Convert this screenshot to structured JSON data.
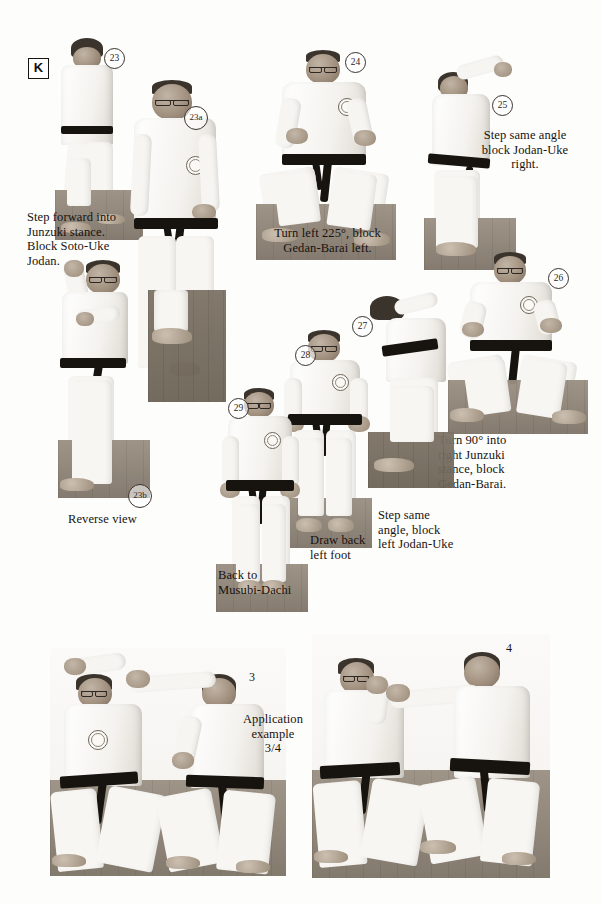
{
  "page": {
    "section_letter": "K",
    "background": "#fdfdfc",
    "ink_color": "#17120f"
  },
  "figures": [
    {
      "id": "23",
      "label": "23"
    },
    {
      "id": "23a",
      "label": "23a"
    },
    {
      "id": "23b",
      "label": "23b"
    },
    {
      "id": "24",
      "label": "24"
    },
    {
      "id": "25",
      "label": "25"
    },
    {
      "id": "26",
      "label": "26"
    },
    {
      "id": "27",
      "label": "27"
    },
    {
      "id": "28",
      "label": "28"
    },
    {
      "id": "29",
      "label": "29"
    }
  ],
  "captions": {
    "step23": "Step forward into\nJunzuki stance.\nBlock Soto-Uke\nJodan.",
    "reverse_view": "Reverse view",
    "step24": "Turn left 225°, block\nGedan-Barai left.",
    "step25": "Step same angle\nblock Jodan-Uke\nright.",
    "step26": "Turn 90° into\nright Junzuki\nstance, block\nGedan-Barai.",
    "step27": "Step same\nangle, block\nleft Jodan-Uke",
    "step28": "Draw back\nleft foot",
    "step29": "Back to\nMusubi-Dachi",
    "application": "Application\nexample\n3/4"
  },
  "application_labels": {
    "left": "3",
    "right": "4"
  }
}
